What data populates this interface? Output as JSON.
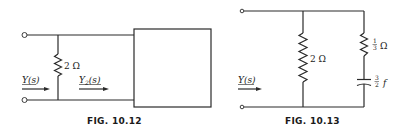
{
  "figures": [
    {
      "caption": "FIG. 10.12",
      "resistor_label": "2 Ω",
      "input_admittance_label": "Y(s)",
      "load_admittance_label_main": "Y",
      "load_admittance_label_sub": "2",
      "load_admittance_label_tail": "(s)",
      "load": "network box"
    },
    {
      "caption": "FIG. 10.13",
      "shunt_resistor_label": "2 Ω",
      "series_resistor_label_num": "1",
      "series_resistor_label_den": "3",
      "series_resistor_unit": "Ω",
      "capacitor_label_num": "3",
      "capacitor_label_den": "2",
      "capacitor_unit": "f",
      "input_admittance_label": "Y(s)"
    }
  ],
  "colors": {
    "ink": "#2a2a2a",
    "background": "#ffffff"
  }
}
